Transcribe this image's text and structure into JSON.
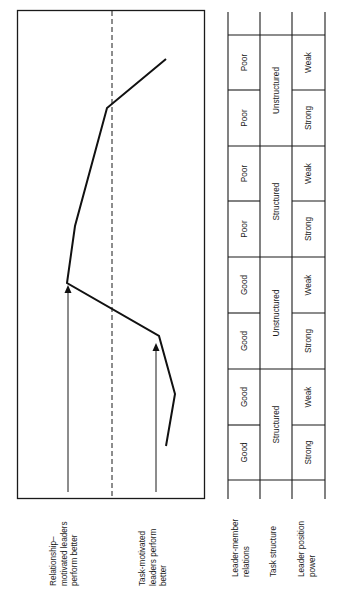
{
  "chart_data": {
    "type": "line",
    "title": "",
    "orientation": "rotated-90deg",
    "xlabel": "Situational favorableness (Octants I–VIII)",
    "ylabel": "",
    "y_axis_annotations": [
      {
        "text": "Relationship-motivated leaders perform better",
        "side": "above-zero"
      },
      {
        "text": "Task-motivated leaders perform better",
        "side": "below-zero"
      }
    ],
    "reference_line": {
      "style": "dashed",
      "value": 0
    },
    "categories": [
      "I",
      "II",
      "III",
      "IV",
      "V",
      "VI",
      "VII",
      "VIII"
    ],
    "series": [
      {
        "name": "Correlation between leader LPC and group performance",
        "values": [
          -0.52,
          -0.58,
          -0.41,
          0.47,
          0.36,
          0.24,
          -0.05,
          -0.43
        ]
      }
    ],
    "condition_table": {
      "rows": [
        {
          "label": "Leader-member relations",
          "cells": [
            "Good",
            "Good",
            "Good",
            "Good",
            "Poor",
            "Poor",
            "Poor",
            "Poor"
          ]
        },
        {
          "label": "Task structure",
          "cells": [
            "Structured",
            "Unstructured",
            "Structured",
            "Unstructured"
          ],
          "span": 2
        },
        {
          "label": "Leader position power",
          "cells": [
            "Strong",
            "Weak",
            "Strong",
            "Weak",
            "Strong",
            "Weak",
            "Strong",
            "Weak"
          ]
        }
      ]
    },
    "grid": false,
    "legend": "none"
  },
  "labels": {
    "relationship": [
      "Relationship–",
      "motivated leaders",
      "perform better"
    ],
    "task": [
      "Task-motivated",
      "leaders perform",
      "better"
    ],
    "lmr": [
      "Leader-member",
      "relations"
    ],
    "ts": [
      "Task structure"
    ],
    "lpp": [
      "Leader position",
      "power"
    ]
  },
  "table": {
    "lmr": [
      "Good",
      "Good",
      "Good",
      "Good",
      "Poor",
      "Poor",
      "Poor",
      "Poor"
    ],
    "ts": [
      "Structured",
      "Unstructured",
      "Structured",
      "Unstructured"
    ],
    "lpp": [
      "Strong",
      "Weak",
      "Strong",
      "Weak",
      "Strong",
      "Weak",
      "Strong",
      "Weak"
    ]
  },
  "colors": {
    "ink": "#1a1a1a",
    "background": "#ffffff"
  }
}
